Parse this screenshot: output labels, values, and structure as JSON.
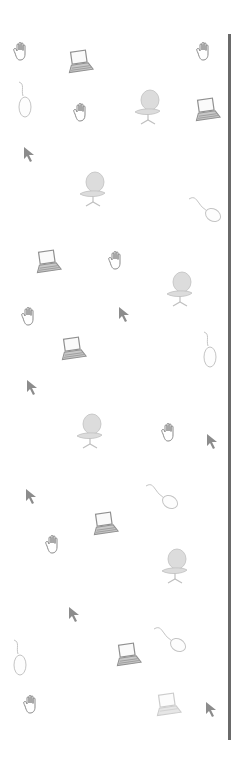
{
  "background": "#ffffff",
  "divider": {
    "x": 228,
    "top": 34,
    "height": 706,
    "color": "#6a6a6a"
  },
  "colors": {
    "hand_stroke": "#8a8a8a",
    "laptop": "#909090",
    "laptop_light": "#c8c8c8",
    "mouse_stroke": "#c4c4c4",
    "chair_fill": "#dcdcdc",
    "chair_stroke": "#c0c0c0",
    "cursor": "#8c8c8c"
  },
  "icons": [
    {
      "type": "hand",
      "x": 22,
      "y": 52
    },
    {
      "type": "laptop",
      "x": 80,
      "y": 62
    },
    {
      "type": "hand",
      "x": 205,
      "y": 52
    },
    {
      "type": "mouse",
      "x": 25,
      "y": 100
    },
    {
      "type": "hand",
      "x": 82,
      "y": 113
    },
    {
      "type": "chair",
      "x": 148,
      "y": 108
    },
    {
      "type": "laptop",
      "x": 207,
      "y": 110
    },
    {
      "type": "cursor",
      "x": 30,
      "y": 155
    },
    {
      "type": "chair",
      "x": 93,
      "y": 190
    },
    {
      "type": "mouse-diag",
      "x": 205,
      "y": 210
    },
    {
      "type": "laptop",
      "x": 48,
      "y": 262
    },
    {
      "type": "hand",
      "x": 117,
      "y": 261
    },
    {
      "type": "chair",
      "x": 180,
      "y": 290
    },
    {
      "type": "hand",
      "x": 30,
      "y": 317
    },
    {
      "type": "cursor",
      "x": 125,
      "y": 315
    },
    {
      "type": "mouse",
      "x": 210,
      "y": 350
    },
    {
      "type": "laptop",
      "x": 73,
      "y": 349
    },
    {
      "type": "cursor",
      "x": 33,
      "y": 388
    },
    {
      "type": "chair",
      "x": 90,
      "y": 432
    },
    {
      "type": "hand",
      "x": 170,
      "y": 433
    },
    {
      "type": "cursor",
      "x": 213,
      "y": 442
    },
    {
      "type": "mouse-diag",
      "x": 162,
      "y": 497
    },
    {
      "type": "cursor",
      "x": 32,
      "y": 497
    },
    {
      "type": "laptop",
      "x": 105,
      "y": 524
    },
    {
      "type": "hand",
      "x": 54,
      "y": 545
    },
    {
      "type": "chair",
      "x": 175,
      "y": 567
    },
    {
      "type": "cursor",
      "x": 75,
      "y": 615
    },
    {
      "type": "mouse",
      "x": 20,
      "y": 658
    },
    {
      "type": "mouse-diag",
      "x": 170,
      "y": 640
    },
    {
      "type": "laptop",
      "x": 128,
      "y": 655
    },
    {
      "type": "hand",
      "x": 32,
      "y": 705
    },
    {
      "type": "laptop-faded",
      "x": 168,
      "y": 705
    },
    {
      "type": "cursor",
      "x": 212,
      "y": 710
    }
  ]
}
